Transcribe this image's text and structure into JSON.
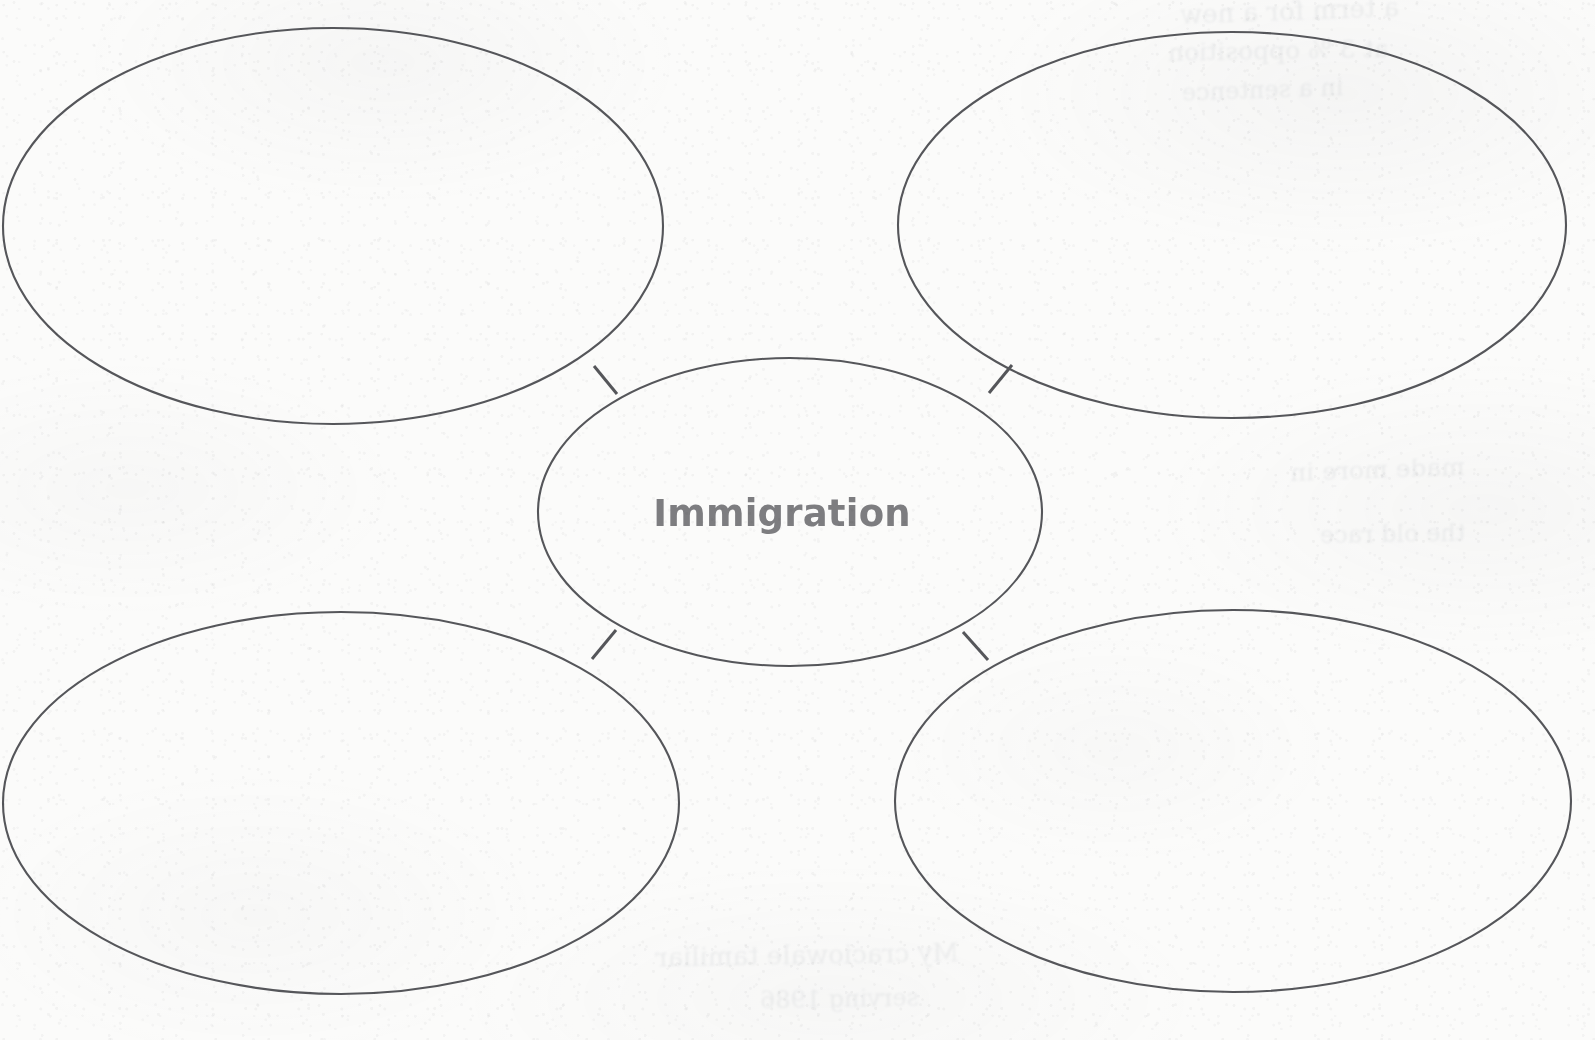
{
  "worksheet": {
    "type": "concept-web",
    "title": "Immigration",
    "background_color": "#fbfbfa",
    "stroke_color": "#55565a",
    "label_color": "#7d7d80",
    "stroke_width": 2.1
  },
  "center_bubble": {
    "label": "Immigration",
    "cx": 790,
    "cy": 512,
    "rx": 252,
    "ry": 154,
    "text_x": 782,
    "text_y": 515
  },
  "branch_bubbles": [
    {
      "name": "top-left",
      "label": "",
      "cx": 333,
      "cy": 226,
      "rx": 330,
      "ry": 198
    },
    {
      "name": "top-right",
      "label": "",
      "cx": 1232,
      "cy": 225,
      "rx": 334,
      "ry": 193
    },
    {
      "name": "bottom-left",
      "label": "",
      "cx": 341,
      "cy": 803,
      "rx": 338,
      "ry": 191
    },
    {
      "name": "bottom-right",
      "label": "",
      "cx": 1233,
      "cy": 801,
      "rx": 338,
      "ry": 191
    }
  ],
  "connectors": [
    {
      "name": "connector-top-left",
      "x1": 594,
      "y1": 366,
      "x2": 617,
      "y2": 394
    },
    {
      "name": "connector-top-right",
      "x1": 989,
      "y1": 393,
      "x2": 1012,
      "y2": 365
    },
    {
      "name": "connector-bottom-left",
      "x1": 616,
      "y1": 630,
      "x2": 592,
      "y2": 659
    },
    {
      "name": "connector-bottom-right",
      "x1": 963,
      "y1": 632,
      "x2": 988,
      "y2": 660
    }
  ],
  "bleed_through": [
    {
      "text": "a term for a new",
      "x": 1180,
      "y": -4,
      "size": 26,
      "rotate": -2
    },
    {
      "text": "at 3 % opposition",
      "x": 1168,
      "y": 36,
      "size": 25,
      "rotate": -1
    },
    {
      "text": "in a sentence",
      "x": 1182,
      "y": 76,
      "size": 24,
      "rotate": -2
    },
    {
      "text": "made more in",
      "x": 1290,
      "y": 455,
      "size": 25,
      "rotate": -2
    },
    {
      "text": "the old race",
      "x": 1320,
      "y": 520,
      "size": 24,
      "rotate": -1
    },
    {
      "text": "My craciowale tamiliar",
      "x": 655,
      "y": 940,
      "size": 26,
      "rotate": -1
    },
    {
      "text": "serving 1986",
      "x": 760,
      "y": 985,
      "size": 24,
      "rotate": -1
    }
  ]
}
